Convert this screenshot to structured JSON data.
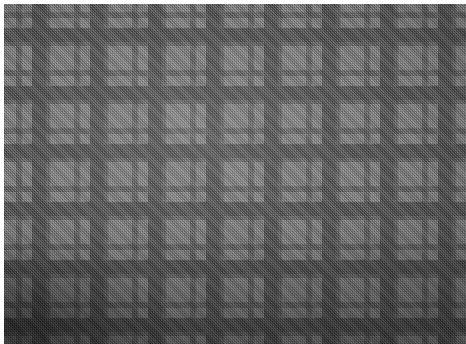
{
  "image": {
    "kind": "tartan-fabric-swatch",
    "description": "Grayscale tartan / plaid woven fabric, photographed flat",
    "width_px": 466,
    "height_px": 344,
    "background_color": "#ffffff",
    "margin_px": 4
  },
  "palette": {
    "light_gray": "#8e8e8e",
    "mid_gray": "#6b6b6b",
    "dark_gray": "#3a3a3a",
    "charcoal": "#242424",
    "black": "#0b0b0b"
  },
  "sett": {
    "repeat_px": 58,
    "symmetric": true,
    "weave": "2/2 twill",
    "twill_direction": "right-hand (45 degrees)",
    "thread_px": 2,
    "warp_offset_px": -6,
    "weft_offset_px": -10,
    "warp_stripes": [
      {
        "color_key": "light_gray",
        "color": "#8e8e8e",
        "width_px": 18
      },
      {
        "color_key": "dark_gray",
        "color": "#3a3a3a",
        "width_px": 6
      },
      {
        "color_key": "light_gray",
        "color": "#8e8e8e",
        "width_px": 10
      },
      {
        "color_key": "black",
        "color": "#0b0b0b",
        "width_px": 14
      },
      {
        "color_key": "dark_gray",
        "color": "#3a3a3a",
        "width_px": 4
      },
      {
        "color_key": "light_gray",
        "color": "#8e8e8e",
        "width_px": 6
      }
    ],
    "weft_stripes": [
      {
        "color_key": "light_gray",
        "color": "#8e8e8e",
        "width_px": 18
      },
      {
        "color_key": "dark_gray",
        "color": "#3a3a3a",
        "width_px": 6
      },
      {
        "color_key": "light_gray",
        "color": "#8e8e8e",
        "width_px": 10
      },
      {
        "color_key": "black",
        "color": "#0b0b0b",
        "width_px": 14
      },
      {
        "color_key": "dark_gray",
        "color": "#3a3a3a",
        "width_px": 4
      },
      {
        "color_key": "light_gray",
        "color": "#8e8e8e",
        "width_px": 6
      }
    ]
  },
  "lighting": {
    "vignette": true,
    "darkest_corner": "bottom-left",
    "highlight_center": "42% 38%"
  }
}
